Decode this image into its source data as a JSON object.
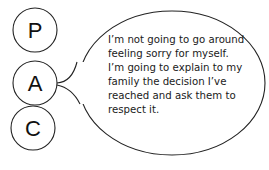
{
  "diagram": {
    "circles": [
      {
        "label": "P"
      },
      {
        "label": "A"
      },
      {
        "label": "C"
      }
    ],
    "speech_bubble": {
      "attached_to": "A",
      "lines": [
        "I’m not going to go around",
        "feeling sorry for myself.",
        "I’m going to explain to my",
        "family the decision I’ve",
        "reached and ask them to",
        "respect it."
      ]
    },
    "colors": {
      "stroke": "#222222",
      "background": "#ffffff",
      "text": "#1a1a1a"
    }
  }
}
